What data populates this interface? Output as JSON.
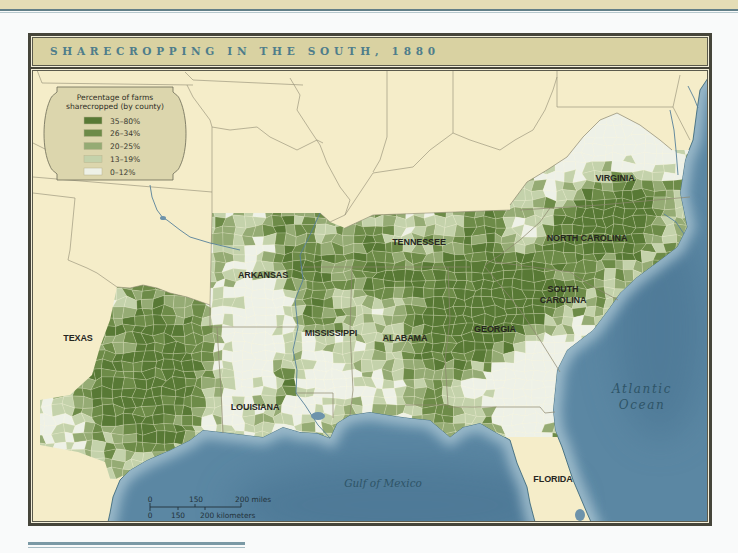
{
  "map": {
    "title": "SHARECROPPING IN THE SOUTH, 1880",
    "legend": {
      "title_line1": "Percentage of farms",
      "title_line2": "sharecropped (by county)",
      "classes": [
        {
          "label": "35–80%",
          "color": "#587935"
        },
        {
          "label": "26–34%",
          "color": "#6d8b48"
        },
        {
          "label": "20–25%",
          "color": "#95ab74"
        },
        {
          "label": "13–19%",
          "color": "#c4d2ab"
        },
        {
          "label": "0–12%",
          "color": "#eef1e7"
        }
      ]
    },
    "state_labels": [
      {
        "name": "TEXAS"
      },
      {
        "name": "ARKANSAS"
      },
      {
        "name": "MISSISSIPPI"
      },
      {
        "name": "LOUISIANA"
      },
      {
        "name": "ALABAMA"
      },
      {
        "name": "TENNESSEE"
      },
      {
        "name": "GEORGIA"
      },
      {
        "name": "SOUTH CAROLINA",
        "lines": [
          "SOUTH",
          "CAROLINA"
        ]
      },
      {
        "name": "NORTH CAROLINA"
      },
      {
        "name": "VIRGINIA"
      },
      {
        "name": "FLORIDA"
      }
    ],
    "water_labels": {
      "atlantic": [
        "Atlantic",
        "Ocean"
      ],
      "gulf": "Gulf of Mexico"
    },
    "scale_bar": {
      "miles": [
        "0",
        "150",
        "200 miles"
      ],
      "kilometers": [
        "0",
        "150",
        "200 kilometers"
      ]
    },
    "colors": {
      "land": "#f5edc9",
      "water": "#5b87a3",
      "title_text": "#4e7d8b",
      "title_bar": "#d9d2a2",
      "frame": "#46453a",
      "legend_box": "#dcd6ad"
    },
    "shading": {
      "base": 0.42,
      "noise": 0.36,
      "thresholds": [
        0.72,
        0.56,
        0.42,
        0.27
      ],
      "hotspots": [
        [
          150,
          330,
          35,
          0.32
        ],
        [
          125,
          405,
          28,
          0.35
        ],
        [
          95,
          395,
          20,
          0.15
        ],
        [
          175,
          430,
          20,
          0.28
        ],
        [
          200,
          360,
          22,
          0.22
        ],
        [
          165,
          380,
          22,
          0.22
        ],
        [
          60,
          420,
          28,
          -0.22
        ],
        [
          205,
          450,
          20,
          -0.3
        ],
        [
          140,
          470,
          15,
          -0.15
        ],
        [
          105,
          300,
          15,
          -0.12
        ],
        [
          255,
          265,
          40,
          -0.12
        ],
        [
          285,
          225,
          14,
          0.3
        ],
        [
          285,
          265,
          12,
          0.25
        ],
        [
          232,
          233,
          10,
          0.2
        ],
        [
          245,
          300,
          15,
          -0.15
        ],
        [
          270,
          310,
          12,
          -0.2
        ],
        [
          255,
          360,
          35,
          -0.35
        ],
        [
          285,
          380,
          14,
          0.42
        ],
        [
          270,
          410,
          12,
          0.15
        ],
        [
          240,
          420,
          15,
          -0.05
        ],
        [
          300,
          410,
          14,
          -0.25
        ],
        [
          315,
          270,
          20,
          0.38
        ],
        [
          320,
          310,
          18,
          0.32
        ],
        [
          340,
          300,
          18,
          -0.18
        ],
        [
          335,
          375,
          22,
          -0.3
        ],
        [
          330,
          345,
          12,
          0.05
        ],
        [
          395,
          278,
          28,
          0.38
        ],
        [
          365,
          255,
          14,
          0.2
        ],
        [
          420,
          235,
          25,
          -0.12
        ],
        [
          455,
          240,
          20,
          0.05
        ],
        [
          490,
          230,
          18,
          0.18
        ],
        [
          395,
          305,
          25,
          -0.22
        ],
        [
          380,
          330,
          15,
          -0.05
        ],
        [
          420,
          355,
          25,
          0.18
        ],
        [
          400,
          395,
          18,
          -0.15
        ],
        [
          430,
          300,
          15,
          0.05
        ],
        [
          480,
          300,
          40,
          0.45
        ],
        [
          470,
          345,
          22,
          0.25
        ],
        [
          500,
          265,
          15,
          0.15
        ],
        [
          510,
          330,
          20,
          0.2
        ],
        [
          515,
          390,
          25,
          -0.45
        ],
        [
          545,
          370,
          25,
          -0.5
        ],
        [
          470,
          390,
          15,
          -0.2
        ],
        [
          530,
          285,
          22,
          0.32
        ],
        [
          555,
          300,
          18,
          0.15
        ],
        [
          575,
          330,
          18,
          -0.1
        ],
        [
          590,
          300,
          12,
          0.05
        ],
        [
          600,
          225,
          30,
          0.38
        ],
        [
          565,
          235,
          18,
          0.22
        ],
        [
          635,
          240,
          18,
          0.2
        ],
        [
          650,
          210,
          12,
          0.12
        ],
        [
          515,
          240,
          15,
          -0.2
        ],
        [
          545,
          225,
          12,
          -0.1
        ],
        [
          615,
          195,
          22,
          0.35
        ],
        [
          640,
          180,
          15,
          0.1
        ],
        [
          630,
          135,
          28,
          -0.45
        ],
        [
          580,
          170,
          25,
          -0.35
        ],
        [
          655,
          160,
          15,
          -0.2
        ],
        [
          665,
          195,
          12,
          0.05
        ],
        [
          440,
          415,
          10,
          0.35
        ],
        [
          490,
          415,
          12,
          0.3
        ],
        [
          520,
          425,
          15,
          -0.3
        ],
        [
          465,
          430,
          10,
          -0.1
        ]
      ]
    }
  }
}
